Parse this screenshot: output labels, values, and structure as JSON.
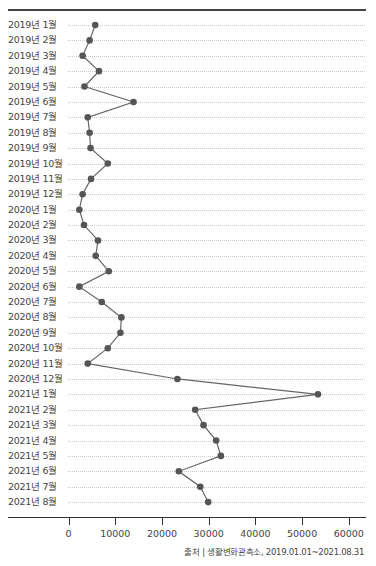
{
  "chart_data": {
    "type": "line",
    "orientation": "horizontal",
    "title": "",
    "xlabel": "",
    "ylabel": "",
    "xlim": [
      0,
      60000
    ],
    "x_ticks": [
      "0",
      "10000",
      "20000",
      "30000",
      "40000",
      "50000",
      "60000"
    ],
    "grid": "dotted horizontal",
    "legend": null,
    "categories": [
      "2019년 1월",
      "2019년 2월",
      "2019년 3월",
      "2019년 4월",
      "2019년 5월",
      "2019년 6월",
      "2019년 7월",
      "2019년 8월",
      "2019년 9월",
      "2019년 10월",
      "2019년 11월",
      "2019년 12월",
      "2020년 1월",
      "2020년 2월",
      "2020년 3월",
      "2020년 4월",
      "2020년 5월",
      "2020년 6월",
      "2020년 7월",
      "2020년 8월",
      "2020년 9월",
      "2020년 10월",
      "2020년 11월",
      "2020년 12월",
      "2021년 1월",
      "2021년 2월",
      "2021년 3월",
      "2021년 4월",
      "2021년 5월",
      "2021년 6월",
      "2021년 7월",
      "2021년 8월"
    ],
    "values": [
      5700,
      4500,
      3000,
      6500,
      3400,
      13900,
      4100,
      4500,
      4700,
      8400,
      4800,
      3000,
      2300,
      3300,
      6300,
      5800,
      8600,
      2300,
      7100,
      11300,
      11100,
      8400,
      4100,
      23300,
      53400,
      27100,
      28900,
      31600,
      32600,
      23600,
      28200,
      29900
    ],
    "colors": {
      "line": "#666666",
      "point": "#555555",
      "grid": "#c8c8c8",
      "axis": "#333333"
    }
  },
  "source": "출처 | 생활변화관측소, 2019.01.01~2021.08.31"
}
